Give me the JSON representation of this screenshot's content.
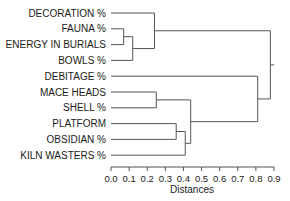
{
  "chart_data": {
    "type": "dendrogram",
    "title": "",
    "xlabel": "Distances",
    "ylabel": "",
    "xlim": [
      0.0,
      0.9
    ],
    "xticks": [
      "0.0",
      "0.1",
      "0.2",
      "0.3",
      "0.4",
      "0.5",
      "0.6",
      "0.7",
      "0.8",
      "0.9"
    ],
    "leaves": [
      "DECORATION %",
      "FAUNA %",
      "ENERGY IN BURIALS",
      "BOWLS %",
      "DEBITAGE %",
      "MACE HEADS",
      "SHELL %",
      "PLATFORM",
      "OBSIDIAN %",
      "KILN WASTERS %"
    ],
    "merges": [
      {
        "id": "c1",
        "left": "FAUNA %",
        "right": "ENERGY IN BURIALS",
        "distance": 0.07
      },
      {
        "id": "c2",
        "left": "c1",
        "right": "BOWLS %",
        "distance": 0.12
      },
      {
        "id": "c3",
        "left": "DECORATION %",
        "right": "c2",
        "distance": 0.24
      },
      {
        "id": "c4",
        "left": "MACE HEADS",
        "right": "SHELL %",
        "distance": 0.25
      },
      {
        "id": "c5",
        "left": "PLATFORM",
        "right": "OBSIDIAN %",
        "distance": 0.36
      },
      {
        "id": "c6",
        "left": "c5",
        "right": "KILN WASTERS %",
        "distance": 0.41
      },
      {
        "id": "c7",
        "left": "c4",
        "right": "c6",
        "distance": 0.44
      },
      {
        "id": "c8",
        "left": "DEBITAGE %",
        "right": "c7",
        "distance": 0.81
      },
      {
        "id": "c9",
        "left": "c3",
        "right": "c8",
        "distance": 0.88
      }
    ],
    "root_stub_to": 0.9,
    "grid": false
  }
}
